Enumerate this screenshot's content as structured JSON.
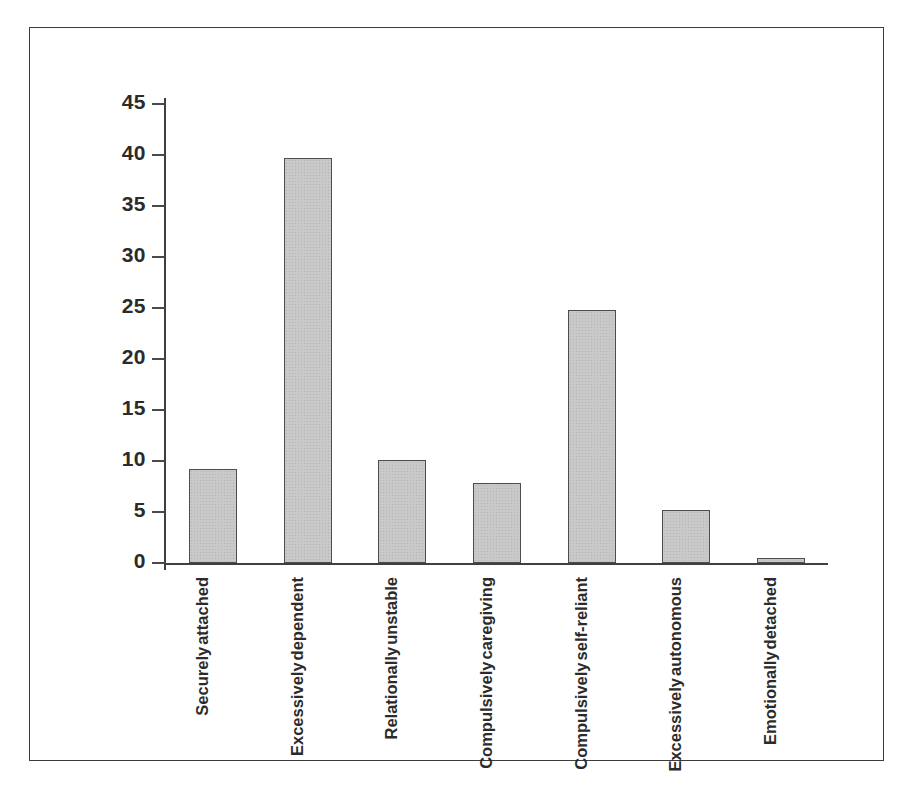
{
  "figure": {
    "border_color": "#3c3c3c",
    "background": "#ffffff"
  },
  "chart_data": {
    "type": "bar",
    "title": "",
    "subtitle": "",
    "xlabel": "",
    "ylabel": "",
    "ylim": [
      0,
      45
    ],
    "y_ticks": [
      0,
      5,
      10,
      15,
      20,
      25,
      30,
      35,
      40,
      45
    ],
    "grid": false,
    "legend": null,
    "bar_color": "#c9c9c9",
    "bar_edge_color": "#4d4d4d",
    "categories": [
      "Securely attached",
      "Excessively dependent",
      "Relationally unstable",
      "Compulsively caregiving",
      "Compulsively self-reliant",
      "Excessively autonomous",
      "Emotionally detached"
    ],
    "category_lines": [
      [
        "Securely",
        "attached"
      ],
      [
        "Excessively",
        "dependent"
      ],
      [
        "Relationally",
        "unstable"
      ],
      [
        "Compulsively",
        "caregiving"
      ],
      [
        "Compulsively",
        "self-reliant"
      ],
      [
        "Excessively",
        "autonomous"
      ],
      [
        "Emotionally",
        "detached"
      ]
    ],
    "values": [
      9.2,
      39.7,
      10.1,
      7.8,
      24.8,
      5.2,
      0.4
    ]
  }
}
